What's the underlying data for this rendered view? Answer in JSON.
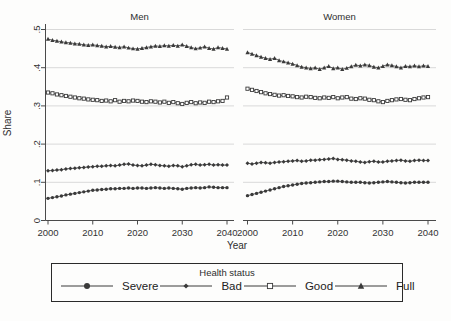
{
  "figure": {
    "clipped_title": "2000-2040",
    "ylabel": "Share",
    "xlabel": "Year"
  },
  "legend": {
    "title": "Health status",
    "entries": [
      {
        "label": "Severe",
        "marker": "circle"
      },
      {
        "label": "Bad",
        "marker": "diamond"
      },
      {
        "label": "Good",
        "marker": "square-open"
      },
      {
        "label": "Full",
        "marker": "triangle"
      }
    ]
  },
  "colors": {
    "series": "#3a3a3a",
    "grid": "#d9d9d9",
    "axis": "#4a4a4a",
    "text": "#333333",
    "background": "#fdfdfc"
  },
  "chart_data": {
    "type": "line",
    "x": [
      2000,
      2001,
      2002,
      2003,
      2004,
      2005,
      2006,
      2007,
      2008,
      2009,
      2010,
      2011,
      2012,
      2013,
      2014,
      2015,
      2016,
      2017,
      2018,
      2019,
      2020,
      2021,
      2022,
      2023,
      2024,
      2025,
      2026,
      2027,
      2028,
      2029,
      2030,
      2031,
      2032,
      2033,
      2034,
      2035,
      2036,
      2037,
      2038,
      2039,
      2040
    ],
    "xticks": [
      2000,
      2010,
      2020,
      2030,
      2040
    ],
    "ylim": [
      0,
      0.5
    ],
    "yticks": [
      0,
      0.1,
      0.2,
      0.3,
      0.4,
      0.5
    ],
    "ytick_labels": [
      "0",
      ".1",
      ".2",
      ".3",
      ".4",
      ".5"
    ],
    "grid": true,
    "legend_position": "bottom",
    "panels": [
      {
        "title": "Men",
        "series": [
          {
            "name": "Severe",
            "marker": "circle",
            "values": [
              0.058,
              0.06,
              0.062,
              0.064,
              0.067,
              0.069,
              0.071,
              0.073,
              0.075,
              0.077,
              0.079,
              0.08,
              0.081,
              0.082,
              0.083,
              0.083,
              0.084,
              0.084,
              0.085,
              0.084,
              0.085,
              0.085,
              0.084,
              0.085,
              0.086,
              0.085,
              0.084,
              0.085,
              0.084,
              0.083,
              0.082,
              0.084,
              0.085,
              0.086,
              0.085,
              0.086,
              0.088,
              0.087,
              0.086,
              0.086,
              0.086
            ]
          },
          {
            "name": "Bad",
            "marker": "diamond",
            "values": [
              0.13,
              0.131,
              0.132,
              0.133,
              0.135,
              0.136,
              0.137,
              0.138,
              0.139,
              0.14,
              0.141,
              0.142,
              0.142,
              0.143,
              0.144,
              0.143,
              0.145,
              0.147,
              0.148,
              0.145,
              0.144,
              0.143,
              0.145,
              0.147,
              0.146,
              0.144,
              0.143,
              0.142,
              0.144,
              0.143,
              0.141,
              0.143,
              0.146,
              0.147,
              0.145,
              0.146,
              0.147,
              0.145,
              0.146,
              0.145,
              0.145
            ]
          },
          {
            "name": "Good",
            "marker": "square-open",
            "values": [
              0.335,
              0.333,
              0.33,
              0.328,
              0.326,
              0.324,
              0.322,
              0.32,
              0.319,
              0.317,
              0.316,
              0.315,
              0.313,
              0.314,
              0.312,
              0.315,
              0.311,
              0.313,
              0.312,
              0.314,
              0.313,
              0.311,
              0.31,
              0.312,
              0.311,
              0.309,
              0.311,
              0.308,
              0.31,
              0.307,
              0.305,
              0.308,
              0.31,
              0.307,
              0.309,
              0.308,
              0.311,
              0.31,
              0.312,
              0.313,
              0.322
            ]
          },
          {
            "name": "Full",
            "marker": "triangle",
            "values": [
              0.475,
              0.472,
              0.47,
              0.468,
              0.466,
              0.465,
              0.463,
              0.462,
              0.46,
              0.459,
              0.46,
              0.458,
              0.457,
              0.455,
              0.456,
              0.454,
              0.453,
              0.455,
              0.452,
              0.45,
              0.449,
              0.451,
              0.453,
              0.455,
              0.457,
              0.456,
              0.458,
              0.457,
              0.459,
              0.457,
              0.46,
              0.456,
              0.453,
              0.45,
              0.452,
              0.455,
              0.451,
              0.449,
              0.453,
              0.451,
              0.449
            ]
          }
        ]
      },
      {
        "title": "Women",
        "series": [
          {
            "name": "Severe",
            "marker": "circle",
            "values": [
              0.065,
              0.068,
              0.071,
              0.074,
              0.077,
              0.08,
              0.083,
              0.086,
              0.089,
              0.091,
              0.093,
              0.095,
              0.097,
              0.098,
              0.099,
              0.1,
              0.101,
              0.102,
              0.102,
              0.103,
              0.103,
              0.102,
              0.101,
              0.1,
              0.1,
              0.1,
              0.099,
              0.098,
              0.099,
              0.1,
              0.101,
              0.102,
              0.101,
              0.1,
              0.099,
              0.098,
              0.099,
              0.1,
              0.1,
              0.1,
              0.1
            ]
          },
          {
            "name": "Bad",
            "marker": "diamond",
            "values": [
              0.15,
              0.148,
              0.15,
              0.152,
              0.151,
              0.15,
              0.152,
              0.153,
              0.154,
              0.155,
              0.156,
              0.157,
              0.155,
              0.156,
              0.158,
              0.158,
              0.159,
              0.16,
              0.161,
              0.162,
              0.16,
              0.159,
              0.158,
              0.156,
              0.155,
              0.153,
              0.152,
              0.154,
              0.155,
              0.153,
              0.153,
              0.155,
              0.156,
              0.157,
              0.158,
              0.156,
              0.155,
              0.157,
              0.158,
              0.157,
              0.157
            ]
          },
          {
            "name": "Good",
            "marker": "square-open",
            "values": [
              0.345,
              0.342,
              0.339,
              0.336,
              0.333,
              0.331,
              0.329,
              0.327,
              0.328,
              0.326,
              0.325,
              0.323,
              0.322,
              0.324,
              0.323,
              0.321,
              0.32,
              0.322,
              0.321,
              0.323,
              0.32,
              0.322,
              0.323,
              0.319,
              0.318,
              0.32,
              0.319,
              0.316,
              0.315,
              0.312,
              0.31,
              0.313,
              0.315,
              0.317,
              0.318,
              0.316,
              0.315,
              0.318,
              0.32,
              0.322,
              0.323
            ]
          },
          {
            "name": "Full",
            "marker": "triangle",
            "values": [
              0.44,
              0.436,
              0.432,
              0.428,
              0.425,
              0.422,
              0.425,
              0.419,
              0.416,
              0.413,
              0.41,
              0.406,
              0.402,
              0.4,
              0.398,
              0.4,
              0.396,
              0.4,
              0.404,
              0.398,
              0.4,
              0.396,
              0.399,
              0.403,
              0.407,
              0.405,
              0.408,
              0.406,
              0.402,
              0.4,
              0.404,
              0.408,
              0.406,
              0.403,
              0.4,
              0.404,
              0.403,
              0.405,
              0.403,
              0.405,
              0.404
            ]
          }
        ]
      }
    ]
  }
}
